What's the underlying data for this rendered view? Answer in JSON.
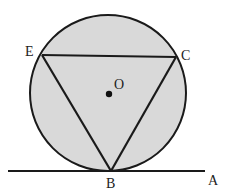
{
  "diagram": {
    "type": "geometry",
    "colors": {
      "circle_fill": "#d9d9d9",
      "stroke": "#1a1a1a",
      "background": "#ffffff"
    },
    "circle": {
      "center": [
        108,
        93
      ],
      "radius": 78,
      "label": "O"
    },
    "points": {
      "E": {
        "x": 42,
        "y": 55,
        "label": "E"
      },
      "C": {
        "x": 176,
        "y": 57,
        "label": "C"
      },
      "B": {
        "x": 111,
        "y": 171,
        "label": "B"
      },
      "A": {
        "x": 205,
        "y": 171,
        "label": "A"
      },
      "O": {
        "x": 109,
        "y": 94,
        "label": "O"
      }
    },
    "tangent_line": {
      "from": [
        8,
        171
      ],
      "to": [
        205,
        171
      ]
    }
  }
}
